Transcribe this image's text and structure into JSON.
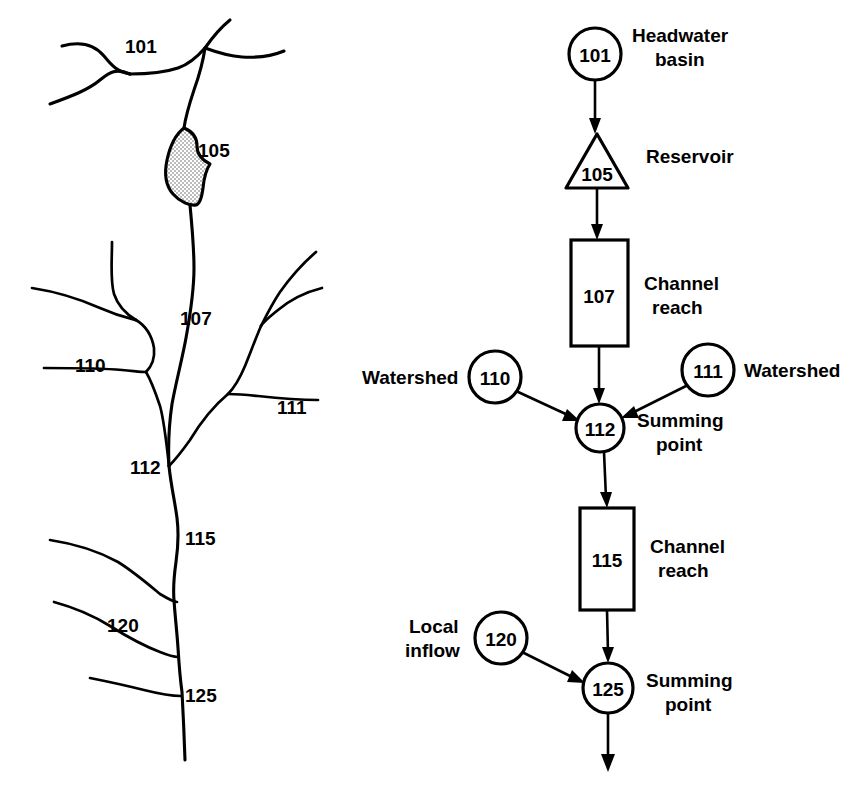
{
  "figure": {
    "background_color": "#ffffff",
    "ink_color": "#000000"
  },
  "stream_map": {
    "name": "stream-network-map",
    "reach_labels": [
      {
        "id": "101",
        "text": "101",
        "x": 125,
        "y": 53
      },
      {
        "id": "105",
        "text": "105",
        "x": 198,
        "y": 157
      },
      {
        "id": "107",
        "text": "107",
        "x": 180,
        "y": 325
      },
      {
        "id": "110",
        "text": "110",
        "x": 75,
        "y": 372
      },
      {
        "id": "111",
        "text": "111",
        "x": 277,
        "y": 414
      },
      {
        "id": "112",
        "text": "112",
        "x": 130,
        "y": 474
      },
      {
        "id": "115",
        "text": "115",
        "x": 185,
        "y": 545
      },
      {
        "id": "120",
        "text": "120",
        "x": 107,
        "y": 632
      },
      {
        "id": "125",
        "text": "125",
        "x": 185,
        "y": 702
      }
    ],
    "reservoir_fill": "#e8e8e8"
  },
  "schematic": {
    "name": "schematic-flow-diagram",
    "nodes": [
      {
        "id": "101",
        "number": "101",
        "shape": "circle",
        "label": "Headwater basin",
        "label_lines": [
          "Headwater",
          "basin"
        ],
        "label_side": "right",
        "cx": 595,
        "cy": 54,
        "r": 26
      },
      {
        "id": "105",
        "number": "105",
        "shape": "triangle",
        "label": "Reservoir",
        "label_lines": [
          "Reservoir"
        ],
        "label_side": "right",
        "cx": 597,
        "cy": 163,
        "half_width": 30,
        "top_y": 134,
        "base_y": 188
      },
      {
        "id": "107",
        "number": "107",
        "shape": "rectangle",
        "label": "Channel reach",
        "label_lines": [
          "Channel",
          "reach"
        ],
        "label_side": "right",
        "x": 571,
        "y": 240,
        "w": 57,
        "h": 106
      },
      {
        "id": "110",
        "number": "110",
        "shape": "circle",
        "label": "Watershed",
        "label_lines": [
          "Watershed"
        ],
        "label_side": "left",
        "cx": 495,
        "cy": 377,
        "r": 26
      },
      {
        "id": "111",
        "number": "111",
        "shape": "circle",
        "label": "Watershed",
        "label_lines": [
          "Watershed"
        ],
        "label_side": "right",
        "cx": 708,
        "cy": 370,
        "r": 26
      },
      {
        "id": "112",
        "number": "112",
        "shape": "circle",
        "label": "Summing point",
        "label_lines": [
          "Summing",
          "point"
        ],
        "label_side": "right",
        "cx": 600,
        "cy": 428,
        "r": 24
      },
      {
        "id": "115",
        "number": "115",
        "shape": "rectangle",
        "label": "Channel reach",
        "label_lines": [
          "Channel",
          "reach"
        ],
        "label_side": "right",
        "x": 580,
        "y": 508,
        "w": 54,
        "h": 102
      },
      {
        "id": "120",
        "number": "120",
        "shape": "circle",
        "label": "Local inflow",
        "label_lines": [
          "Local",
          "inflow"
        ],
        "label_side": "left",
        "cx": 501,
        "cy": 638,
        "r": 26
      },
      {
        "id": "125",
        "number": "125",
        "shape": "circle",
        "label": "Summing point",
        "label_lines": [
          "Summing",
          "point"
        ],
        "label_side": "right",
        "cx": 608,
        "cy": 688,
        "r": 25
      }
    ],
    "connections": [
      {
        "from": "101",
        "to": "105",
        "style": "vertical-arrow"
      },
      {
        "from": "105",
        "to": "107",
        "style": "vertical-arrow"
      },
      {
        "from": "107",
        "to": "112",
        "style": "vertical-arrow"
      },
      {
        "from": "110",
        "to": "112",
        "style": "diagonal-arrow"
      },
      {
        "from": "111",
        "to": "112",
        "style": "diagonal-arrow"
      },
      {
        "from": "112",
        "to": "115",
        "style": "vertical-arrow"
      },
      {
        "from": "115",
        "to": "125",
        "style": "vertical-arrow"
      },
      {
        "from": "120",
        "to": "125",
        "style": "diagonal-arrow"
      },
      {
        "from": "125",
        "to": "outlet",
        "style": "vertical-arrow"
      }
    ]
  }
}
